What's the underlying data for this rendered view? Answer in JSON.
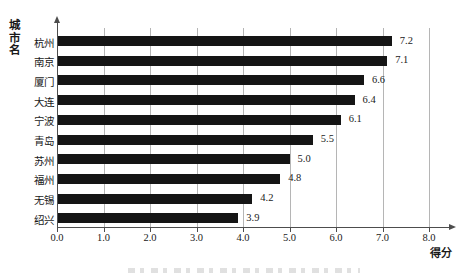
{
  "chart_data": {
    "type": "bar",
    "orientation": "horizontal",
    "title": "",
    "xlabel": "得分",
    "ylabel": "城市名",
    "categories": [
      "杭州",
      "南京",
      "厦门",
      "大连",
      "宁波",
      "青岛",
      "苏州",
      "福州",
      "无锡",
      "绍兴"
    ],
    "values": [
      7.2,
      7.1,
      6.6,
      6.4,
      6.1,
      5.5,
      5.0,
      4.8,
      4.2,
      3.9
    ],
    "value_labels": [
      "7.2",
      "7.1",
      "6.6",
      "6.4",
      "6.1",
      "5.5",
      "5.0",
      "4.8",
      "4.2",
      "3.9"
    ],
    "xlim": [
      0,
      8
    ],
    "xtick_values": [
      0,
      1,
      2,
      3,
      4,
      5,
      6,
      7,
      8
    ],
    "xtick_labels": [
      "0.0",
      "1.0",
      "2.0",
      "3.0",
      "4.0",
      "5.0",
      "6.0",
      "7.0",
      "8.0"
    ],
    "grid": true,
    "legend": false,
    "bar_color": "#151515",
    "gridline_color": "#b5b5b5",
    "axis_color": "#4d4d4d",
    "text_color": "#1a1a1a"
  }
}
